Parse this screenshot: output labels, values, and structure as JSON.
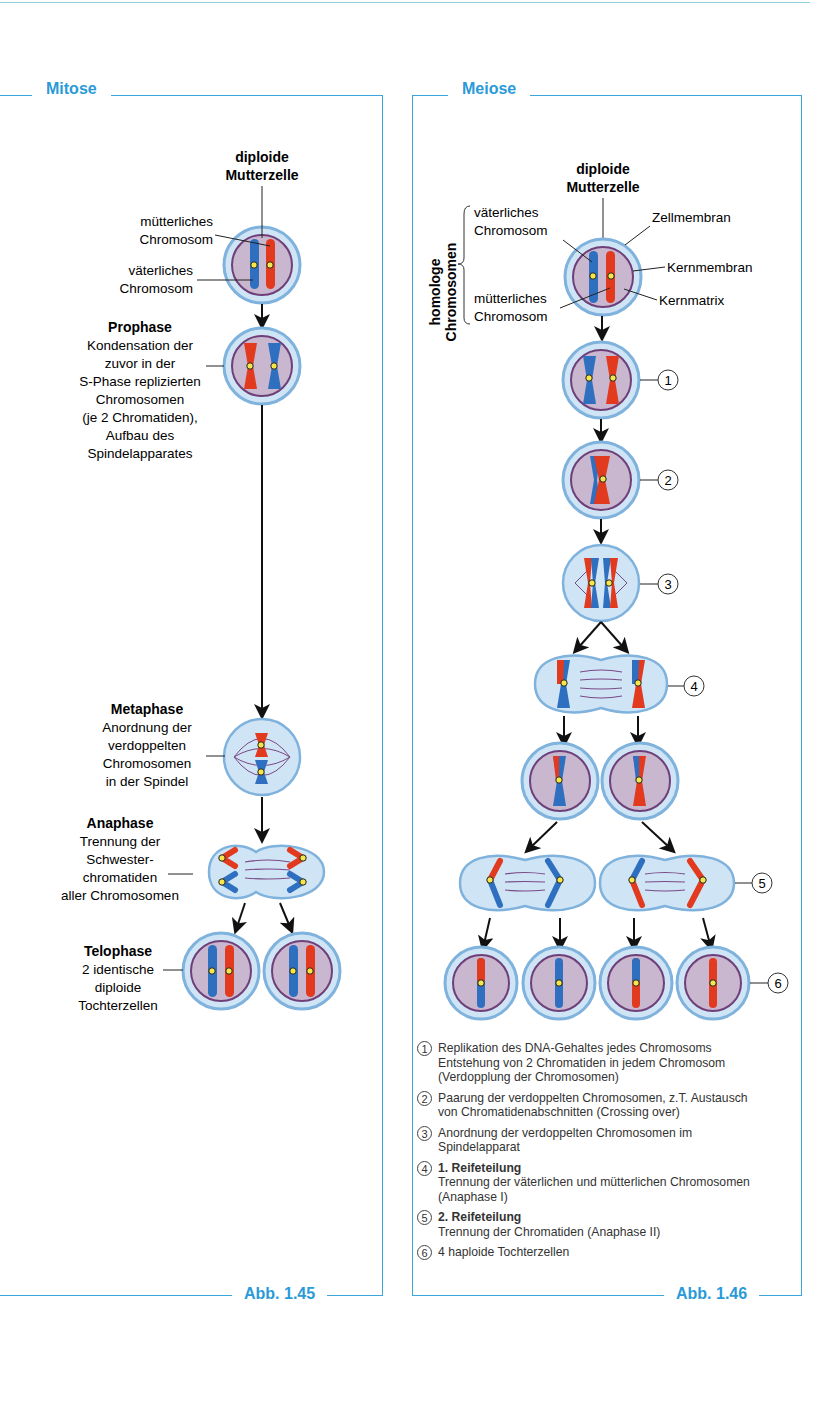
{
  "mitose": {
    "title": "Mitose",
    "figure": "Abb. 1.45",
    "mother": {
      "title1": "diploide",
      "title2": "Mutterzelle",
      "label_m1": "mütterliches",
      "label_m2": "Chromosom",
      "label_v1": "väterliches",
      "label_v2": "Chromosom"
    },
    "prophase": {
      "title": "Prophase",
      "lines": [
        "Kondensation der",
        "zuvor in der",
        "S-Phase replizierten",
        "Chromosomen",
        "(je 2 Chromatiden),",
        "Aufbau des",
        "Spindelapparates"
      ]
    },
    "metaphase": {
      "title": "Metaphase",
      "lines": [
        "Anordnung der",
        "verdoppelten",
        "Chromosomen",
        "in der Spindel"
      ]
    },
    "anaphase": {
      "title": "Anaphase",
      "lines": [
        "Trennung der",
        "Schwester-",
        "chromatiden",
        "aller Chromosomen"
      ]
    },
    "telophase": {
      "title": "Telophase",
      "lines": [
        "2 identische",
        "diploide",
        "Tochterzellen"
      ]
    }
  },
  "meiose": {
    "title": "Meiose",
    "figure": "Abb. 1.46",
    "mother": {
      "title1": "diploide",
      "title2": "Mutterzelle"
    },
    "homologe1": "homologe",
    "homologe2": "Chromosomen",
    "labels": {
      "v1": "väterliches",
      "v2": "Chromosom",
      "m1": "mütterliches",
      "m2": "Chromosom",
      "zellmembran": "Zellmembran",
      "kernmembran": "Kernmembran",
      "kernmatrix": "Kernmatrix"
    },
    "steps": [
      "1",
      "2",
      "3",
      "4",
      "5",
      "6"
    ],
    "legend": [
      {
        "num": "1",
        "bold": "",
        "lines": [
          "Replikation des DNA-Gehaltes jedes Chromosoms",
          "Entstehung von 2 Chromatiden in jedem Chromosom",
          "(Verdopplung der Chromosomen)"
        ]
      },
      {
        "num": "2",
        "bold": "",
        "lines": [
          "Paarung der verdoppelten Chromosomen, z.T. Austausch",
          "von Chromatidenabschnitten (Crossing over)"
        ]
      },
      {
        "num": "3",
        "bold": "",
        "lines": [
          "Anordnung der verdoppelten Chromosomen im",
          "Spindelapparat"
        ]
      },
      {
        "num": "4",
        "bold": "1. Reifeteilung",
        "lines": [
          "Trennung der väterlichen und mütterlichen Chromosomen",
          "(Anaphase I)"
        ]
      },
      {
        "num": "5",
        "bold": "2. Reifeteilung",
        "lines": [
          "Trennung der Chromatiden (Anaphase II)"
        ]
      },
      {
        "num": "6",
        "bold": "",
        "lines": [
          "4 haploide Tochterzellen"
        ]
      }
    ]
  },
  "colors": {
    "accent": "#2a9ad8",
    "paternal": "#2f6fbf",
    "maternal": "#e23a1e",
    "cytoplasm": "#cfe4f5",
    "nucleus": "#c9b6cf",
    "nuclear_membrane": "#6e3f78"
  }
}
